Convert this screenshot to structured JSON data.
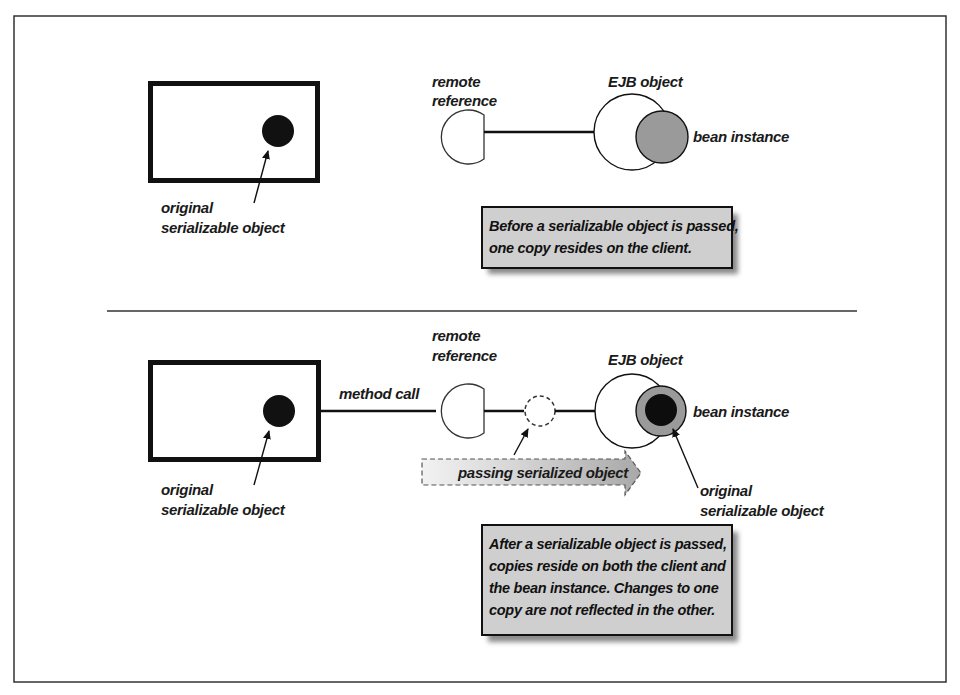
{
  "figure": {
    "top_panel": {
      "client_box": {
        "label_line1": "original",
        "label_line2": "serializable object"
      },
      "remote_reference": {
        "label_line1": "remote",
        "label_line2": "reference"
      },
      "ejb_object": {
        "label": "EJB object"
      },
      "bean_instance": {
        "label": "bean instance"
      },
      "note": {
        "line1": "Before a serializable object is passed,",
        "line2": "one copy resides on the client."
      }
    },
    "bottom_panel": {
      "client_box": {
        "label_line1": "original",
        "label_line2": "serializable object"
      },
      "method_call": {
        "label": "method call"
      },
      "remote_reference": {
        "label_line1": "remote",
        "label_line2": "reference"
      },
      "ejb_object": {
        "label": "EJB object"
      },
      "bean_instance": {
        "label": "bean instance"
      },
      "passing_arrow": {
        "label": "passing serialized object"
      },
      "bean_object": {
        "label_line1": "original",
        "label_line2": "serializable object"
      },
      "note": {
        "line1": "After a serializable object is passed,",
        "line2": "copies reside on both the client and",
        "line3": "the bean instance. Changes to one",
        "line4": "copy are not reflected in the other."
      }
    },
    "colors": {
      "stroke": "#111111",
      "bean_fill": "#9a9a9a",
      "note_fill": "#cfcfcf",
      "shadow": "#8a8a8a"
    }
  }
}
